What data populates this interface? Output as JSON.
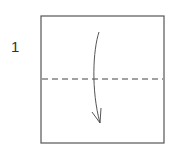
{
  "step": {
    "number": "1"
  },
  "diagram": {
    "square": {
      "x": 41,
      "y": 16,
      "width": 123,
      "height": 127,
      "stroke": "#555555"
    },
    "fold_line": {
      "type": "valley-fold-dashed",
      "y": 79,
      "stroke": "#444444"
    },
    "arrow": {
      "direction": "down",
      "description": "fold top half down along dashed line",
      "stroke": "#555555"
    }
  }
}
